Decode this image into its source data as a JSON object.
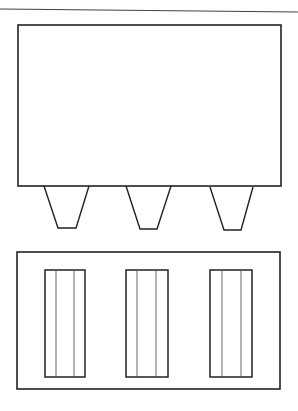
{
  "diagram": {
    "type": "line-drawing",
    "stroke_color": "#222222",
    "background": "#ffffff",
    "top_rule": {
      "x1": 0,
      "y1": 9,
      "x2": 298,
      "y2": 12
    },
    "upper_body": {
      "x": 18,
      "y": 25,
      "w": 263,
      "h": 161
    },
    "protrusions": [
      {
        "top_left": 44,
        "top_right": 89,
        "bottom_left": 58,
        "bottom_right": 76,
        "y_top": 186,
        "y_bottom": 228
      },
      {
        "top_left": 126,
        "top_right": 171,
        "bottom_left": 140,
        "bottom_right": 157,
        "y_top": 186,
        "y_bottom": 229
      },
      {
        "top_left": 210,
        "top_right": 253,
        "bottom_left": 224,
        "bottom_right": 241,
        "y_top": 187,
        "y_bottom": 230
      }
    ],
    "lower_body": {
      "x": 17,
      "y": 252,
      "w": 263,
      "h": 137
    },
    "slots": [
      {
        "x": 45,
        "y": 270,
        "w": 40,
        "h": 107,
        "inner_lines": [
          56,
          74
        ]
      },
      {
        "x": 126,
        "y": 270,
        "w": 42,
        "h": 107,
        "inner_lines": [
          137,
          156
        ]
      },
      {
        "x": 210,
        "y": 270,
        "w": 42,
        "h": 107,
        "inner_lines": [
          222,
          241
        ]
      }
    ]
  }
}
